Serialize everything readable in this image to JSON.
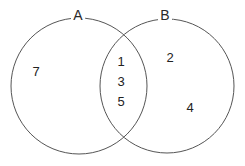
{
  "diagram": {
    "type": "venn",
    "sets": [
      {
        "label": "A",
        "only_elements": [
          "7"
        ]
      },
      {
        "label": "B",
        "only_elements": [
          "2",
          "4"
        ]
      }
    ],
    "intersection_elements": [
      "1",
      "3",
      "5"
    ],
    "colors": {
      "stroke": "#555555",
      "text": "#222222"
    }
  }
}
